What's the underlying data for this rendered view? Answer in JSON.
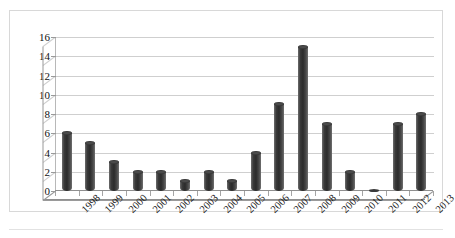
{
  "chart_data": {
    "type": "bar",
    "title": "",
    "subtitle": "",
    "xlabel": "",
    "ylabel": "",
    "categories": [
      "1998",
      "1999",
      "2000",
      "2001",
      "2002",
      "2003",
      "2004",
      "2005",
      "2006",
      "2007",
      "2008",
      "2009",
      "2010",
      "2011",
      "2012",
      "2013"
    ],
    "values": [
      6,
      5,
      3,
      2,
      2,
      1,
      2,
      1,
      4,
      9,
      15,
      7,
      2,
      0,
      7,
      8
    ],
    "ylim": [
      0,
      16
    ],
    "ytick_labels": [
      "0",
      "2",
      "4",
      "6",
      "8",
      "10",
      "12",
      "14",
      "16"
    ],
    "ytick_values": [
      0,
      2,
      4,
      6,
      8,
      10,
      12,
      14,
      16
    ],
    "grid": true,
    "grid_orientation": "horizontal",
    "legend": false,
    "legend_position": "none",
    "style": "3d-cylinder-bars",
    "series": [
      {
        "name": "",
        "values": [
          6,
          5,
          3,
          2,
          2,
          1,
          2,
          1,
          4,
          9,
          15,
          7,
          2,
          0,
          7,
          8
        ]
      }
    ],
    "colors": {
      "bar": "#3a3a3a",
      "bar_highlight": "#6d6d6d",
      "gridline": "#cfcfcf",
      "axis": "#8f8f8f",
      "border": "#d8d8d8",
      "background": "#ffffff",
      "text": "#111111"
    }
  }
}
